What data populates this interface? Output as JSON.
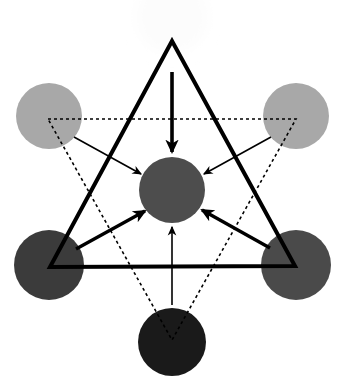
{
  "figure": {
    "width": 344,
    "height": 386,
    "background_color": "#ffffff"
  },
  "chart_data": {
    "type": "diagram",
    "title": "",
    "nodes": [
      {
        "id": "top",
        "label": "",
        "cx": 172,
        "cy": 17,
        "r": 36,
        "fill": "#fcfcfc",
        "role": "outer-node",
        "blurred": true
      },
      {
        "id": "top-left",
        "label": "",
        "cx": 49,
        "cy": 116,
        "r": 33,
        "fill": "#a8a8a8",
        "role": "outer-node",
        "blurred": false
      },
      {
        "id": "top-right",
        "label": "",
        "cx": 296,
        "cy": 116,
        "r": 33,
        "fill": "#a8a8a8",
        "role": "outer-node",
        "blurred": false
      },
      {
        "id": "bottom-left",
        "label": "",
        "cx": 49,
        "cy": 265,
        "r": 35,
        "fill": "#3b3b3b",
        "role": "outer-node",
        "blurred": false
      },
      {
        "id": "bottom-right",
        "label": "",
        "cx": 296,
        "cy": 265,
        "r": 35,
        "fill": "#4a4a4a",
        "role": "outer-node",
        "blurred": false
      },
      {
        "id": "bottom",
        "label": "",
        "cx": 172,
        "cy": 342,
        "r": 34,
        "fill": "#1a1a1a",
        "role": "outer-node",
        "blurred": false
      },
      {
        "id": "center",
        "label": "",
        "cx": 172,
        "cy": 190,
        "r": 33,
        "fill": "#4d4d4d",
        "role": "center-node",
        "blurred": false
      }
    ],
    "triangles": [
      {
        "id": "solid-triangle",
        "orientation": "point-up",
        "style": "solid",
        "stroke": "#000000",
        "stroke_width": 4,
        "points": [
          [
            172,
            41
          ],
          [
            295,
            266
          ],
          [
            50,
            267
          ]
        ]
      },
      {
        "id": "dotted-triangle",
        "orientation": "point-down",
        "style": "dotted",
        "stroke": "#000000",
        "stroke_width": 1.6,
        "dash": "3 3",
        "points": [
          [
            48,
            119
          ],
          [
            296,
            119
          ],
          [
            172,
            340
          ]
        ]
      }
    ],
    "arrows": [
      {
        "id": "arrow-top-to-center",
        "from": "top",
        "to": "center",
        "weight": "thick",
        "stroke": "#000000",
        "stroke_width": 3.6,
        "x1": 172,
        "y1": 72,
        "x2": 172,
        "y2": 152
      },
      {
        "id": "arrow-top-left-to-center",
        "from": "top-left",
        "to": "center",
        "weight": "thin",
        "stroke": "#000000",
        "stroke_width": 1.6,
        "x1": 74,
        "y1": 137,
        "x2": 141,
        "y2": 174
      },
      {
        "id": "arrow-top-right-to-center",
        "from": "top-right",
        "to": "center",
        "weight": "thin",
        "stroke": "#000000",
        "stroke_width": 1.6,
        "x1": 271,
        "y1": 137,
        "x2": 204,
        "y2": 174
      },
      {
        "id": "arrow-bottom-left-to-center",
        "from": "bottom-left",
        "to": "center",
        "weight": "thick",
        "stroke": "#000000",
        "stroke_width": 3.4,
        "x1": 76,
        "y1": 249,
        "x2": 145,
        "y2": 211
      },
      {
        "id": "arrow-bottom-right-to-center",
        "from": "bottom-right",
        "to": "center",
        "weight": "thick",
        "stroke": "#000000",
        "stroke_width": 3.4,
        "x1": 270,
        "y1": 248,
        "x2": 202,
        "y2": 210
      },
      {
        "id": "arrow-bottom-to-center",
        "from": "bottom",
        "to": "center",
        "weight": "thin",
        "stroke": "#000000",
        "stroke_width": 1.6,
        "x1": 172,
        "y1": 305,
        "x2": 172,
        "y2": 227
      }
    ],
    "legend": {
      "entries": [],
      "position": "none"
    },
    "grid": false,
    "xlabel": "",
    "ylabel": ""
  }
}
